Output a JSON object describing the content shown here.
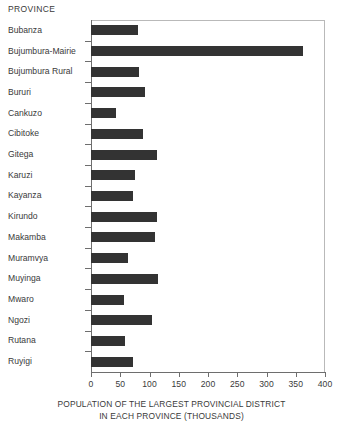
{
  "header": {
    "category_axis_label": "PROVINCE"
  },
  "axis": {
    "x_title_line1": "POPULATION OF THE LARGEST PROVINCIAL DISTRICT",
    "x_title_line2": "IN EACH PROVINCE (THOUSANDS)",
    "x_ticks": [
      "0",
      "50",
      "100",
      "150",
      "200",
      "250",
      "300",
      "350",
      "400"
    ]
  },
  "colors": {
    "bar": "#333333",
    "axis": "#6e6e6e",
    "frame": "#b9b9b9",
    "text": "#3a3a3a",
    "background": "#ffffff"
  },
  "chart_data": {
    "type": "bar",
    "orientation": "horizontal",
    "title": "",
    "subtitle": "",
    "xlabel": "POPULATION OF THE LARGEST PROVINCIAL DISTRICT IN EACH PROVINCE (THOUSANDS)",
    "ylabel": "PROVINCE",
    "xlim": [
      0,
      400
    ],
    "xticks": [
      0,
      50,
      100,
      150,
      200,
      250,
      300,
      350,
      400
    ],
    "grid": false,
    "legend": false,
    "categories": [
      "Bubanza",
      "Bujumbura-Mairie",
      "Bujumbura Rural",
      "Bururi",
      "Cankuzo",
      "Cibitoke",
      "Gitega",
      "Karuzi",
      "Kayanza",
      "Kirundo",
      "Makamba",
      "Muramvya",
      "Muyinga",
      "Mwaro",
      "Ngozi",
      "Rutana",
      "Ruyigi"
    ],
    "values": [
      80,
      362,
      82,
      92,
      43,
      89,
      113,
      75,
      72,
      113,
      109,
      63,
      114,
      56,
      104,
      58,
      72
    ]
  }
}
